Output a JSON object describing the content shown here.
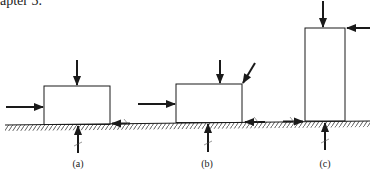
{
  "header": {
    "text": "apter 3."
  },
  "figure": {
    "type": "free-body diagrams of blocks on hatched ground surface",
    "panels": [
      {
        "label": "(a)",
        "description": "Wide low block with horizontal push from left, vertical load on top, upward normal reaction, friction at right base",
        "forces": [
          "horizontal-push-left-side",
          "vertical-down-top",
          "normal-reaction-up",
          "friction-right-base"
        ]
      },
      {
        "label": "(b)",
        "description": "Wide low block with horizontal push from left, vertical load on top, inclined load at top right corner, upward normal reaction, friction arrows at right base",
        "forces": [
          "horizontal-push-left-side",
          "vertical-down-top",
          "inclined-down-top-right-corner",
          "normal-reaction-up",
          "friction-left-pointing-right-base",
          "friction-right-pointing-ground"
        ]
      },
      {
        "label": "(c)",
        "description": "Tall narrow block with vertical load on top, horizontal push at top right from right side, upward normal reaction, friction at left base",
        "forces": [
          "vertical-down-top",
          "horizontal-push-top-right",
          "normal-reaction-up",
          "friction-left-base"
        ]
      }
    ],
    "colors": {
      "line": "#1a1a1a",
      "background": "#ffffff"
    }
  }
}
